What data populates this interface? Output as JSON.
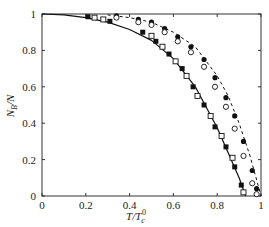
{
  "chart_data": {
    "type": "line",
    "title": "",
    "xlabel": "T/T_c^0",
    "ylabel": "N_B/N",
    "xlim": [
      0,
      1
    ],
    "ylim": [
      0,
      1
    ],
    "xticks": [
      "0",
      "0.2",
      "0.4",
      "0.6",
      "0.8",
      "1"
    ],
    "yticks": [
      "0",
      "0.2",
      "0.4",
      "0.6",
      "0.8",
      "1"
    ],
    "grid": false,
    "legend": null,
    "series": [
      {
        "name": "solid-curve",
        "style": "solid",
        "kind": "line",
        "x": [
          0,
          0.1,
          0.2,
          0.3,
          0.4,
          0.5,
          0.6,
          0.7,
          0.8,
          0.9,
          0.93
        ],
        "y": [
          1.0,
          0.995,
          0.98,
          0.955,
          0.915,
          0.855,
          0.755,
          0.6,
          0.375,
          0.1,
          0.0
        ]
      },
      {
        "name": "filled-squares",
        "style": "marker",
        "marker": "filled-square",
        "x": [
          0.21,
          0.31,
          0.46,
          0.52,
          0.58,
          0.64,
          0.69,
          0.74,
          0.79,
          0.84,
          0.88,
          0.91
        ],
        "y": [
          0.985,
          0.96,
          0.9,
          0.85,
          0.78,
          0.7,
          0.6,
          0.5,
          0.38,
          0.27,
          0.16,
          0.06
        ]
      },
      {
        "name": "open-squares",
        "style": "marker",
        "marker": "open-square",
        "x": [
          0.24,
          0.28,
          0.5,
          0.55,
          0.61,
          0.66,
          0.71,
          0.77,
          0.82,
          0.87,
          0.92
        ],
        "y": [
          0.98,
          0.97,
          0.88,
          0.82,
          0.74,
          0.66,
          0.55,
          0.44,
          0.33,
          0.21,
          0.02
        ]
      },
      {
        "name": "dashed-curve",
        "style": "dashed",
        "kind": "line",
        "x": [
          0.3,
          0.4,
          0.5,
          0.6,
          0.7,
          0.8,
          0.85,
          0.9,
          0.95,
          1.0
        ],
        "y": [
          0.995,
          0.98,
          0.955,
          0.9,
          0.82,
          0.66,
          0.55,
          0.4,
          0.22,
          0.0
        ]
      },
      {
        "name": "filled-circles",
        "style": "marker",
        "marker": "filled-circle",
        "x": [
          0.34,
          0.44,
          0.5,
          0.56,
          0.62,
          0.68,
          0.74,
          0.79,
          0.84,
          0.88,
          0.92,
          0.96,
          0.98
        ],
        "y": [
          0.99,
          0.97,
          0.955,
          0.92,
          0.875,
          0.82,
          0.75,
          0.65,
          0.54,
          0.44,
          0.3,
          0.14,
          0.04
        ]
      },
      {
        "name": "open-circles",
        "style": "marker",
        "marker": "open-circle",
        "x": [
          0.34,
          0.44,
          0.5,
          0.56,
          0.62,
          0.68,
          0.74,
          0.79,
          0.84,
          0.88,
          0.92,
          0.96,
          0.98
        ],
        "y": [
          0.98,
          0.955,
          0.94,
          0.9,
          0.85,
          0.79,
          0.71,
          0.6,
          0.49,
          0.37,
          0.22,
          0.07,
          0.01
        ]
      }
    ]
  },
  "axes": {
    "x_label_main": "T/T",
    "x_label_sub": "c",
    "x_label_sup": "0",
    "y_label_main": "N",
    "y_label_sub": "B",
    "y_label_tail": "/N"
  }
}
